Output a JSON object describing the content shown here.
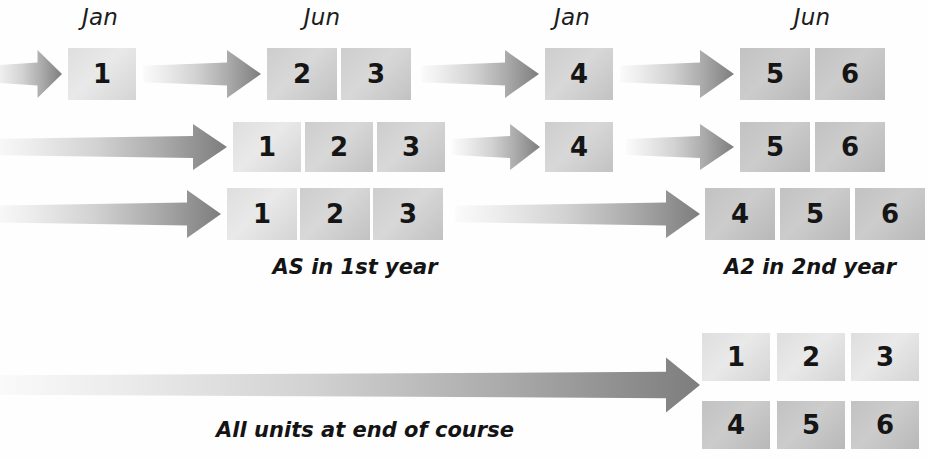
{
  "diagram": {
    "colors": {
      "arrow_light": "#f2f2f2",
      "arrow_dark": "#7a7a7a",
      "box_light": "#e4e4e4",
      "box_dark": "#bdbdbd",
      "text": "#151515"
    },
    "month_labels": [
      {
        "text": "Jan",
        "x": 100,
        "y": 4
      },
      {
        "text": "Jun",
        "x": 322,
        "y": 4
      },
      {
        "text": "Jan",
        "x": 572,
        "y": 4
      },
      {
        "text": "Jun",
        "x": 812,
        "y": 4
      }
    ],
    "rows": [
      {
        "name": "row-1",
        "boxes": [
          {
            "label": "1",
            "x": 68,
            "y": 48,
            "w": 68,
            "h": 52,
            "shade": "light"
          },
          {
            "label": "2",
            "x": 267,
            "y": 48,
            "w": 70,
            "h": 52,
            "shade": "mid"
          },
          {
            "label": "3",
            "x": 341,
            "y": 48,
            "w": 70,
            "h": 52,
            "shade": "mid"
          },
          {
            "label": "4",
            "x": 545,
            "y": 48,
            "w": 68,
            "h": 52,
            "shade": "mid"
          },
          {
            "label": "5",
            "x": 740,
            "y": 48,
            "w": 70,
            "h": 52,
            "shade": "dark"
          },
          {
            "label": "6",
            "x": 815,
            "y": 48,
            "w": 70,
            "h": 52,
            "shade": "dark"
          }
        ],
        "arrows": [
          {
            "x": -10,
            "y": 48,
            "w": 72,
            "h": 52,
            "name": "arrow-to-unit-1"
          },
          {
            "x": 143,
            "y": 48,
            "w": 118,
            "h": 52,
            "name": "arrow-to-units-2-3"
          },
          {
            "x": 421,
            "y": 48,
            "w": 118,
            "h": 52,
            "name": "arrow-to-unit-4"
          },
          {
            "x": 620,
            "y": 48,
            "w": 114,
            "h": 52,
            "name": "arrow-to-units-5-6"
          }
        ]
      },
      {
        "name": "row-2",
        "boxes": [
          {
            "label": "1",
            "x": 233,
            "y": 122,
            "w": 68,
            "h": 50,
            "shade": "light"
          },
          {
            "label": "2",
            "x": 305,
            "y": 122,
            "w": 68,
            "h": 50,
            "shade": "mid"
          },
          {
            "label": "3",
            "x": 377,
            "y": 122,
            "w": 68,
            "h": 50,
            "shade": "mid"
          },
          {
            "label": "4",
            "x": 545,
            "y": 122,
            "w": 68,
            "h": 50,
            "shade": "mid"
          },
          {
            "label": "5",
            "x": 740,
            "y": 122,
            "w": 70,
            "h": 50,
            "shade": "dark"
          },
          {
            "label": "6",
            "x": 815,
            "y": 122,
            "w": 70,
            "h": 50,
            "shade": "dark"
          }
        ],
        "arrows": [
          {
            "x": -10,
            "y": 122,
            "w": 237,
            "h": 50,
            "name": "arrow-to-units-1-2-3"
          },
          {
            "x": 452,
            "y": 122,
            "w": 88,
            "h": 50,
            "name": "arrow-to-unit-4"
          },
          {
            "x": 626,
            "y": 122,
            "w": 108,
            "h": 50,
            "name": "arrow-to-units-5-6"
          }
        ]
      },
      {
        "name": "row-3",
        "boxes": [
          {
            "label": "1",
            "x": 227,
            "y": 188,
            "w": 70,
            "h": 52,
            "shade": "light"
          },
          {
            "label": "2",
            "x": 300,
            "y": 188,
            "w": 70,
            "h": 52,
            "shade": "mid"
          },
          {
            "label": "3",
            "x": 373,
            "y": 188,
            "w": 70,
            "h": 52,
            "shade": "mid"
          },
          {
            "label": "4",
            "x": 705,
            "y": 188,
            "w": 70,
            "h": 52,
            "shade": "dark"
          },
          {
            "label": "5",
            "x": 780,
            "y": 188,
            "w": 70,
            "h": 52,
            "shade": "dark"
          },
          {
            "label": "6",
            "x": 855,
            "y": 188,
            "w": 70,
            "h": 52,
            "shade": "dark"
          }
        ],
        "arrows": [
          {
            "x": -10,
            "y": 188,
            "w": 231,
            "h": 52,
            "name": "arrow-to-units-1-2-3"
          },
          {
            "x": 455,
            "y": 188,
            "w": 245,
            "h": 52,
            "name": "arrow-to-units-4-5-6"
          }
        ]
      }
    ],
    "captions": [
      {
        "text": "AS in 1st year",
        "x": 245,
        "y": 255,
        "w": 220,
        "name": "caption-as-first-year"
      },
      {
        "text": "A2 in 2nd year",
        "x": 700,
        "y": 255,
        "w": 220,
        "name": "caption-a2-second-year"
      },
      {
        "text": "All units at end of course",
        "x": 195,
        "y": 418,
        "w": 340,
        "name": "caption-all-units"
      }
    ],
    "summary": {
      "name": "summary-row",
      "arrow": {
        "x": -10,
        "y": 355,
        "w": 710,
        "h": 60,
        "name": "arrow-all-units"
      },
      "boxes": [
        {
          "label": "1",
          "x": 702,
          "y": 333,
          "w": 68,
          "h": 48,
          "shade": "light"
        },
        {
          "label": "2",
          "x": 777,
          "y": 333,
          "w": 68,
          "h": 48,
          "shade": "light"
        },
        {
          "label": "3",
          "x": 851,
          "y": 333,
          "w": 68,
          "h": 48,
          "shade": "light"
        },
        {
          "label": "4",
          "x": 702,
          "y": 401,
          "w": 68,
          "h": 48,
          "shade": "dark"
        },
        {
          "label": "5",
          "x": 777,
          "y": 401,
          "w": 68,
          "h": 48,
          "shade": "dark"
        },
        {
          "label": "6",
          "x": 851,
          "y": 401,
          "w": 68,
          "h": 48,
          "shade": "dark"
        }
      ]
    }
  }
}
